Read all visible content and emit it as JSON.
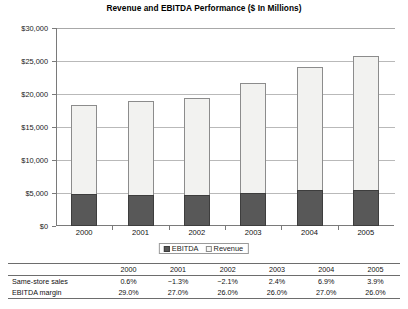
{
  "chart_data": {
    "type": "bar",
    "subtype": "stacked-column",
    "title": "Revenue and EBITDA Performance ($ In Millions)",
    "xlabel": "",
    "ylabel": "",
    "categories": [
      "2000",
      "2001",
      "2002",
      "2003",
      "2004",
      "2005"
    ],
    "series": [
      {
        "name": "EBITDA",
        "values": [
          4800,
          4700,
          4750,
          5000,
          5400,
          5400
        ],
        "color": "#585858"
      },
      {
        "name": "Revenue",
        "values": [
          18300,
          19000,
          19400,
          21700,
          24100,
          25800
        ],
        "color": "#f2f2f0"
      }
    ],
    "stacking_note": "Revenue column drawn full-height; EBITDA drawn as dark lower portion of the same column",
    "ylim": [
      0,
      30000
    ],
    "ytick_values": [
      0,
      5000,
      10000,
      15000,
      20000,
      25000,
      30000
    ],
    "ytick_labels": [
      "$0",
      "$5,000",
      "$10,000",
      "$15,000",
      "$20,000",
      "$25,000",
      "$30,000"
    ],
    "grid": true,
    "legend_position": "bottom-center",
    "legend_entries": [
      "EBITDA",
      "Revenue"
    ]
  },
  "chart": {
    "title": "Revenue and EBITDA Performance ($ In Millions)"
  },
  "legend": {
    "items": [
      {
        "label": "EBITDA",
        "style": "dark"
      },
      {
        "label": "Revenue",
        "style": "light"
      }
    ]
  },
  "table": {
    "corner_label": "",
    "columns": [
      "2000",
      "2001",
      "2002",
      "2003",
      "2004",
      "2005"
    ],
    "rows": [
      {
        "label": "Same-store sales",
        "values": [
          "0.6%",
          "−1.3%",
          "−2.1%",
          "2.4%",
          "6.9%",
          "3.9%"
        ]
      },
      {
        "label": "EBITDA margin",
        "values": [
          "29.0%",
          "27.0%",
          "26.0%",
          "26.0%",
          "27.0%",
          "26.0%"
        ]
      }
    ]
  }
}
